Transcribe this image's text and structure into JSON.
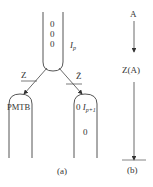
{
  "panel_a": {
    "top_tube": {
      "contents": [
        "0",
        "0",
        "0"
      ],
      "label": "I",
      "label_sub": "p"
    },
    "branch_left_label": "Z",
    "branch_right_label": "Z̄",
    "left_tube_label": "PMTB",
    "right_tube": {
      "first_value": "0",
      "label": "I",
      "label_sub": "p+1",
      "second_value": "0"
    },
    "caption": "(a)"
  },
  "panel_b": {
    "top_label": "A",
    "middle_label": "Z(A)",
    "caption": "(b)"
  },
  "colors": {
    "stroke": "#444444",
    "text": "#333333",
    "background": "#ffffff"
  }
}
